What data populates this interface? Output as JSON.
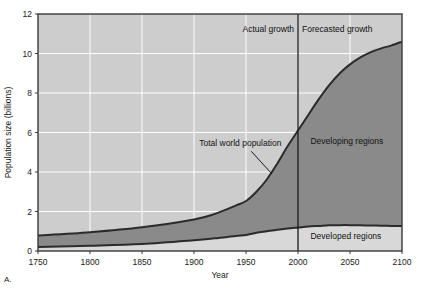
{
  "figure": {
    "panel_letter": "A.",
    "background_color": "#ffffff",
    "plot_background_color": "#cdcdcd",
    "grid_color": "#ffffff",
    "axis_color": "#3a3a3a"
  },
  "chart_data": {
    "type": "area",
    "title": "",
    "subtitle": "",
    "xlabel": "Year",
    "ylabel": "Population size (billions)",
    "xlim": [
      1750,
      2100
    ],
    "ylim": [
      0,
      12
    ],
    "xticks": [
      1750,
      1800,
      1850,
      1900,
      1950,
      2000,
      2050,
      2100
    ],
    "xtick_labels": [
      "1750",
      "1800",
      "1850",
      "1900",
      "1950",
      "2000",
      "2050",
      "2100"
    ],
    "yticks": [
      0,
      2,
      4,
      6,
      8,
      10,
      12
    ],
    "ytick_labels": [
      "0",
      "2",
      "4",
      "6",
      "8",
      "10",
      "12"
    ],
    "grid": true,
    "legend": "inline-labels",
    "stacked": true,
    "x": [
      1750,
      1800,
      1850,
      1900,
      1920,
      1940,
      1950,
      1960,
      1970,
      1980,
      1990,
      2000,
      2010,
      2020,
      2030,
      2040,
      2050,
      2060,
      2070,
      2080,
      2090,
      2100
    ],
    "series": [
      {
        "name": "Developed regions",
        "fill_color": "#d8d8d8",
        "line_color": "#2b2b2b",
        "values": [
          0.2,
          0.26,
          0.35,
          0.54,
          0.64,
          0.76,
          0.81,
          0.92,
          1.0,
          1.08,
          1.14,
          1.19,
          1.24,
          1.27,
          1.3,
          1.31,
          1.31,
          1.3,
          1.29,
          1.28,
          1.27,
          1.26
        ]
      },
      {
        "name": "Developing regions",
        "fill_color": "#8a8a8a",
        "line_color": "#2b2b2b",
        "values": [
          0.58,
          0.69,
          0.85,
          1.06,
          1.24,
          1.54,
          1.72,
          2.08,
          2.62,
          3.34,
          4.16,
          4.91,
          5.66,
          6.42,
          7.1,
          7.68,
          8.14,
          8.5,
          8.78,
          8.98,
          9.14,
          9.34
        ]
      }
    ],
    "total_series": {
      "name": "Total world population",
      "line_color": "#2b2b2b",
      "values": [
        0.78,
        0.95,
        1.2,
        1.6,
        1.88,
        2.3,
        2.53,
        3.0,
        3.62,
        4.42,
        5.3,
        6.1,
        6.9,
        7.69,
        8.4,
        8.99,
        9.45,
        9.8,
        10.07,
        10.26,
        10.41,
        10.6
      ]
    },
    "divider": {
      "x_value": 2000,
      "color": "#1a1a1a",
      "left_label": "Actual growth",
      "right_label": "Forecasted growth"
    },
    "annotations": [
      {
        "name": "total-world-population",
        "text": "Total world population",
        "x": 1905,
        "y": 5.3,
        "leader_from_x": 1955,
        "leader_from_y": 5.05,
        "leader_to_x": 1975,
        "leader_to_y": 3.9
      },
      {
        "name": "developing-regions",
        "text": "Developing regions",
        "x": 2012,
        "y": 5.4
      },
      {
        "name": "developed-regions",
        "text": "Developed regions",
        "x": 2012,
        "y": 0.62
      }
    ]
  }
}
